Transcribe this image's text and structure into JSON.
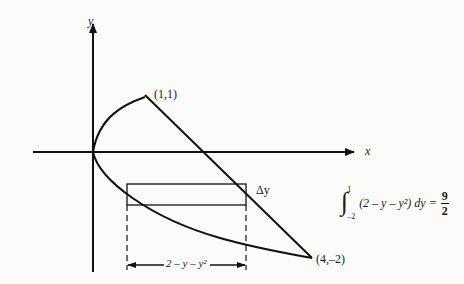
{
  "diagram": {
    "axes": {
      "x_label": "x",
      "y_label": "y",
      "origin_px": [
        93,
        152
      ]
    },
    "points": [
      {
        "label": "(1,1)",
        "x": 1,
        "y": 1
      },
      {
        "label": "(4,–2)",
        "x": 4,
        "y": -2
      }
    ],
    "curves": [
      {
        "name": "parabola",
        "equation": "x = y^2",
        "y_range": [
          -2,
          1
        ]
      },
      {
        "name": "line",
        "equation": "x = 2 - y",
        "y_range": [
          -2,
          1
        ]
      }
    ],
    "strip": {
      "thickness_label": "Δy",
      "width_label": "2 – y – y²"
    },
    "formula": {
      "upper_limit": "1",
      "lower_limit": "–2",
      "integrand": "(2 – y – y²) dy =",
      "result_numerator": "9",
      "result_denominator": "2"
    },
    "colors": {
      "ink": "#111111",
      "background": "#fbfbfa"
    }
  }
}
